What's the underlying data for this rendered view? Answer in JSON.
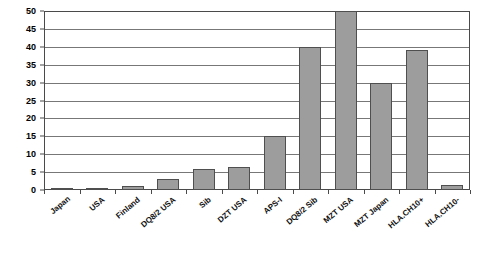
{
  "chart_data": {
    "type": "bar",
    "title": "",
    "subtitle": "",
    "xlabel": "",
    "ylabel": "",
    "ylim": [
      0,
      50
    ],
    "yticks": [
      0,
      5,
      10,
      15,
      20,
      25,
      30,
      35,
      40,
      45,
      50
    ],
    "grid": true,
    "legend": false,
    "legend_position": "none",
    "bar_color": "#9d9d9d",
    "bar_border_color": "#4f4f4f",
    "gridline_color": "#777777",
    "axis_color": "#4a4a4a",
    "categories": [
      "Japan",
      "USA",
      "Finland",
      "DQ8/2 USA",
      "Sib",
      "DZT USA",
      "APS-I",
      "DQ8/2 Sib",
      "MZT USA",
      "MZT Japan",
      "HLA.CH10+",
      "HLA.CH10-"
    ],
    "values": [
      0.3,
      0.5,
      1,
      3,
      6,
      6.5,
      15,
      40,
      50,
      30,
      39,
      1.5
    ]
  }
}
